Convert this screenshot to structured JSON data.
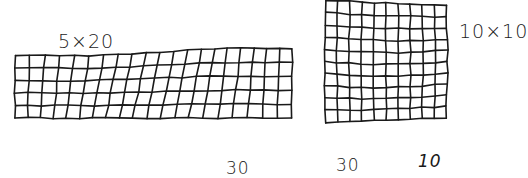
{
  "figure": {
    "grids": [
      {
        "id": "grid-5x20",
        "label": "5×20",
        "rows": 5,
        "cols": 20,
        "bounds": {
          "x": 15,
          "y": 55,
          "w": 277,
          "h": 63
        }
      },
      {
        "id": "grid-10x10",
        "label": "10×10",
        "rows": 10,
        "cols": 10,
        "bounds": {
          "x": 326,
          "y": 3,
          "w": 120,
          "h": 117
        }
      }
    ],
    "bottom_numbers": [
      "30",
      "30",
      "10"
    ],
    "stroke_color": "#1a1a1a",
    "background": "#ffffff"
  }
}
